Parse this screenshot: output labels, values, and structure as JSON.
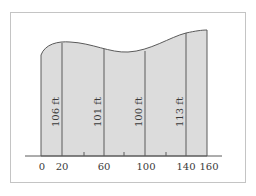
{
  "diagram": {
    "type": "region under curve with vertical strips",
    "colors": {
      "fill": "#dcdcdc",
      "stroke": "#5a5a5a",
      "frame": "#c4c4c4",
      "text": "#3a3a3a"
    },
    "x_ticks": [
      {
        "value": 0,
        "label": "0"
      },
      {
        "value": 20,
        "label": "20"
      },
      {
        "value": 60,
        "label": "60"
      },
      {
        "value": 100,
        "label": "100"
      },
      {
        "value": 140,
        "label": "140"
      },
      {
        "value": 160,
        "label": "160"
      }
    ],
    "minor_ticks": [
      40,
      80,
      120
    ],
    "strips": [
      {
        "x": 20,
        "label": "106 ft"
      },
      {
        "x": 60,
        "label": "101 ft"
      },
      {
        "x": 100,
        "label": "100 ft"
      },
      {
        "x": 140,
        "label": "113 ft"
      }
    ]
  },
  "caption": ""
}
